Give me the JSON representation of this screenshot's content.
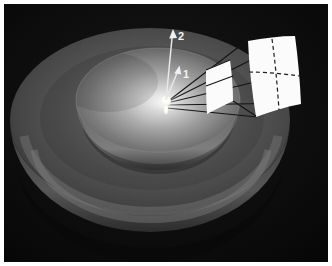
{
  "figure": {
    "kind": "3d-rendered-illustration",
    "canvas": {
      "width": 332,
      "height": 266
    },
    "background_color": "#070707",
    "frame_color": "#ffffff",
    "frame": {
      "x": 4,
      "y": 4,
      "width": 324,
      "height": 258
    }
  },
  "scene": {
    "light_source": {
      "name": "point-light-bulb",
      "color": "#ffffff",
      "glow_color": "#fdfbf0",
      "center": {
        "x": 166,
        "y": 104
      },
      "radius": 5
    },
    "shells": [
      {
        "name": "outer-shell",
        "label": "outer hemisphere",
        "fill_color": "#4a4a4a",
        "center": {
          "x": 150,
          "y": 120
        },
        "rx": 140,
        "ry": 92
      },
      {
        "name": "outer-shell-bowl",
        "label": "outer hemisphere lower bowl",
        "fill_color": "#3d3d3d",
        "center": {
          "x": 150,
          "y": 140
        },
        "rx": 140,
        "ry": 105
      },
      {
        "name": "inner-shell",
        "label": "inner hemisphere",
        "fill_color": "#8b8b8b",
        "center": {
          "x": 158,
          "y": 100
        },
        "rx": 82,
        "ry": 52
      },
      {
        "name": "inner-shell-bowl",
        "label": "inner hemisphere lower bowl",
        "fill_color": "#5a5a5a",
        "center": {
          "x": 158,
          "y": 110
        },
        "rx": 82,
        "ry": 62
      }
    ],
    "arrows": [
      {
        "name": "direction-arrow-2",
        "label": "2",
        "description": "longer, near-vertical direction vector",
        "color": "#e8e8e8",
        "from": {
          "x": 166,
          "y": 100
        },
        "to": {
          "x": 173,
          "y": 31
        },
        "label_pos": {
          "x": 178,
          "y": 39
        }
      },
      {
        "name": "direction-arrow-1",
        "label": "1",
        "description": "shorter direction vector tilted to the right",
        "color": "#e8e8e8",
        "from": {
          "x": 166,
          "y": 100
        },
        "to": {
          "x": 179,
          "y": 67
        },
        "label_pos": {
          "x": 183,
          "y": 78
        }
      }
    ],
    "patches": [
      {
        "name": "near-patch",
        "label": "near solid-angle patch",
        "fill_color": "#fbfbfb",
        "subdivided": false,
        "outline": "M 205 71 L 229 61 L 232 100 L 208 113 Z"
      },
      {
        "name": "far-patch",
        "label": "far solid-angle patch subdivided by dashed lines",
        "fill_color": "#fbfbfb",
        "subdivided": true,
        "outline": "M 247 40 L 294 37 L 300 104 L 255 116 Z",
        "dashed_color": "#1b1b1b"
      }
    ],
    "rays": {
      "name": "light-rays",
      "color": "#131313",
      "count": 5,
      "origin": {
        "x": 166,
        "y": 103
      },
      "endpoints": [
        {
          "x": 248,
          "y": 39
        },
        {
          "x": 296,
          "y": 37
        },
        {
          "x": 300,
          "y": 70
        },
        {
          "x": 301,
          "y": 103
        },
        {
          "x": 256,
          "y": 116
        }
      ]
    }
  }
}
